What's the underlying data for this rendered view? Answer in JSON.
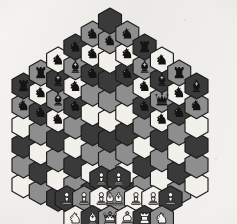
{
  "board": {
    "title": "Hexagonal Chess Board",
    "variant": "Glinski hexagonal chess",
    "orientation": "flat-top-hexagon",
    "columns": 11,
    "total_cells": 91,
    "cell_width_px": 23,
    "cell_height_px": 26,
    "column_step_x_px": 17.3,
    "origin_x_px": 12,
    "origin_y_px": 8,
    "colors": {
      "cell_light": "#f2f0ea",
      "cell_medium": "#8e8e8e",
      "cell_dark": "#3a3a3a",
      "cell_border": "#1c1c1c",
      "piece_black": "#141414",
      "piece_black_outline": "#d8d6d0",
      "piece_white": "#f4f2ec",
      "piece_white_outline": "#141414",
      "background": "#f0eeea"
    },
    "column_labels": [
      "a",
      "b",
      "c",
      "d",
      "e",
      "f",
      "g",
      "h",
      "i",
      "k",
      "l"
    ],
    "column_heights": [
      6,
      7,
      8,
      9,
      10,
      11,
      10,
      9,
      8,
      7,
      6
    ],
    "shade_cycle": [
      "light",
      "medium",
      "dark"
    ],
    "columns_data": [
      {
        "label": "a",
        "cells": [
          {
            "rank": 1,
            "shade": "light",
            "piece": null
          },
          {
            "rank": 2,
            "shade": "medium",
            "piece": null
          },
          {
            "rank": 3,
            "shade": "dark",
            "piece": null
          },
          {
            "rank": 4,
            "shade": "light",
            "piece": null
          },
          {
            "rank": 5,
            "shade": "medium",
            "piece": "black-knight"
          },
          {
            "rank": 6,
            "shade": "dark",
            "piece": "black-rook"
          }
        ]
      },
      {
        "label": "b",
        "cells": [
          {
            "rank": 1,
            "shade": "medium",
            "piece": null
          },
          {
            "rank": 2,
            "shade": "dark",
            "piece": null
          },
          {
            "rank": 3,
            "shade": "light",
            "piece": null
          },
          {
            "rank": 4,
            "shade": "medium",
            "piece": null
          },
          {
            "rank": 5,
            "shade": "dark",
            "piece": "black-knight"
          },
          {
            "rank": 6,
            "shade": "light",
            "piece": "black-knight"
          },
          {
            "rank": 7,
            "shade": "medium",
            "piece": "black-rook"
          }
        ]
      },
      {
        "label": "c",
        "cells": [
          {
            "rank": 1,
            "shade": "dark",
            "piece": null
          },
          {
            "rank": 2,
            "shade": "light",
            "piece": null
          },
          {
            "rank": 3,
            "shade": "medium",
            "piece": null
          },
          {
            "rank": 4,
            "shade": "dark",
            "piece": null
          },
          {
            "rank": 5,
            "shade": "light",
            "piece": "black-knight"
          },
          {
            "rank": 6,
            "shade": "medium",
            "piece": "black-bishop"
          },
          {
            "rank": 7,
            "shade": "dark",
            "piece": "black-bishop"
          },
          {
            "rank": 8,
            "shade": "light",
            "piece": "black-knight"
          }
        ]
      },
      {
        "label": "d",
        "cells": [
          {
            "rank": 1,
            "shade": "light",
            "piece": null
          },
          {
            "rank": 2,
            "shade": "medium",
            "piece": null
          },
          {
            "rank": 3,
            "shade": "dark",
            "piece": null
          },
          {
            "rank": 4,
            "shade": "light",
            "piece": null
          },
          {
            "rank": 5,
            "shade": "medium",
            "piece": null
          },
          {
            "rank": 6,
            "shade": "dark",
            "piece": "black-knight"
          },
          {
            "rank": 7,
            "shade": "light",
            "piece": "black-knight"
          },
          {
            "rank": 8,
            "shade": "medium",
            "piece": "black-bishop"
          },
          {
            "rank": 9,
            "shade": "dark",
            "piece": "black-knight"
          }
        ]
      },
      {
        "label": "e",
        "cells": [
          {
            "rank": 1,
            "shade": "medium",
            "piece": null
          },
          {
            "rank": 2,
            "shade": "dark",
            "piece": null
          },
          {
            "rank": 3,
            "shade": "light",
            "piece": null
          },
          {
            "rank": 4,
            "shade": "medium",
            "piece": null
          },
          {
            "rank": 5,
            "shade": "dark",
            "piece": null
          },
          {
            "rank": 6,
            "shade": "light",
            "piece": null
          },
          {
            "rank": 7,
            "shade": "medium",
            "piece": null
          },
          {
            "rank": 8,
            "shade": "dark",
            "piece": "black-knight"
          },
          {
            "rank": 9,
            "shade": "light",
            "piece": "black-knight"
          },
          {
            "rank": 10,
            "shade": "medium",
            "piece": "black-knight"
          }
        ]
      },
      {
        "label": "f",
        "cells": [
          {
            "rank": 1,
            "shade": "light",
            "piece": "white-king"
          },
          {
            "rank": 2,
            "shade": "dark",
            "piece": "white-bishop"
          },
          {
            "rank": 3,
            "shade": "light",
            "piece": null
          },
          {
            "rank": 4,
            "shade": "medium",
            "piece": null
          },
          {
            "rank": 5,
            "shade": "dark",
            "piece": null
          },
          {
            "rank": 6,
            "shade": "light",
            "piece": null
          },
          {
            "rank": 7,
            "shade": "medium",
            "piece": null
          },
          {
            "rank": 8,
            "shade": "dark",
            "piece": null
          },
          {
            "rank": 9,
            "shade": "light",
            "piece": null
          },
          {
            "rank": 10,
            "shade": "medium",
            "piece": "black-knight"
          },
          {
            "rank": 11,
            "shade": "dark",
            "piece": null
          }
        ]
      },
      {
        "label": "g",
        "cells": [
          {
            "rank": 1,
            "shade": "medium",
            "piece": null
          },
          {
            "rank": 2,
            "shade": "dark",
            "piece": null
          },
          {
            "rank": 3,
            "shade": "light",
            "piece": null
          },
          {
            "rank": 4,
            "shade": "medium",
            "piece": null
          },
          {
            "rank": 5,
            "shade": "dark",
            "piece": null
          },
          {
            "rank": 6,
            "shade": "light",
            "piece": null
          },
          {
            "rank": 7,
            "shade": "medium",
            "piece": null
          },
          {
            "rank": 8,
            "shade": "dark",
            "piece": "black-knight"
          },
          {
            "rank": 9,
            "shade": "light",
            "piece": "black-knight"
          },
          {
            "rank": 10,
            "shade": "medium",
            "piece": "black-knight"
          }
        ]
      },
      {
        "label": "h",
        "cells": [
          {
            "rank": 1,
            "shade": "light",
            "piece": null
          },
          {
            "rank": 2,
            "shade": "medium",
            "piece": null
          },
          {
            "rank": 3,
            "shade": "dark",
            "piece": null
          },
          {
            "rank": 4,
            "shade": "light",
            "piece": null
          },
          {
            "rank": 5,
            "shade": "medium",
            "piece": null
          },
          {
            "rank": 6,
            "shade": "dark",
            "piece": "black-knight"
          },
          {
            "rank": 7,
            "shade": "light",
            "piece": "black-knight"
          },
          {
            "rank": 8,
            "shade": "medium",
            "piece": "black-bishop"
          },
          {
            "rank": 9,
            "shade": "dark",
            "piece": "black-rook"
          }
        ]
      },
      {
        "label": "i",
        "cells": [
          {
            "rank": 1,
            "shade": "dark",
            "piece": null
          },
          {
            "rank": 2,
            "shade": "light",
            "piece": null
          },
          {
            "rank": 3,
            "shade": "medium",
            "piece": null
          },
          {
            "rank": 4,
            "shade": "dark",
            "piece": null
          },
          {
            "rank": 5,
            "shade": "light",
            "piece": "black-knight"
          },
          {
            "rank": 6,
            "shade": "medium",
            "piece": "black-queen"
          },
          {
            "rank": 7,
            "shade": "dark",
            "piece": "black-bishop"
          },
          {
            "rank": 8,
            "shade": "light",
            "piece": "black-knight"
          }
        ]
      },
      {
        "label": "k",
        "cells": [
          {
            "rank": 1,
            "shade": "medium",
            "piece": null
          },
          {
            "rank": 2,
            "shade": "dark",
            "piece": null
          },
          {
            "rank": 3,
            "shade": "light",
            "piece": null
          },
          {
            "rank": 4,
            "shade": "medium",
            "piece": null
          },
          {
            "rank": 5,
            "shade": "dark",
            "piece": "black-knight"
          },
          {
            "rank": 6,
            "shade": "light",
            "piece": "black-knight"
          },
          {
            "rank": 7,
            "shade": "medium",
            "piece": "black-rook"
          }
        ]
      },
      {
        "label": "l",
        "cells": [
          {
            "rank": 1,
            "shade": "light",
            "piece": null
          },
          {
            "rank": 2,
            "shade": "medium",
            "piece": null
          },
          {
            "rank": 3,
            "shade": "dark",
            "piece": null
          },
          {
            "rank": 4,
            "shade": "light",
            "piece": null
          },
          {
            "rank": 5,
            "shade": "medium",
            "piece": "black-knight"
          },
          {
            "rank": 6,
            "shade": "dark",
            "piece": "black-bishop"
          }
        ]
      }
    ],
    "white_back_rank": [
      {
        "piece": "white-knight",
        "shade": "light"
      },
      {
        "piece": "white-bishop",
        "shade": "dark"
      },
      {
        "piece": "white-queen",
        "shade": "medium"
      },
      {
        "piece": "white-king",
        "shade": "light"
      },
      {
        "piece": "white-rook",
        "shade": "dark"
      },
      {
        "piece": "white-knight",
        "shade": "medium"
      }
    ],
    "white_pawn_rank": [
      {
        "piece": "white-pawn",
        "shade": "dark"
      },
      {
        "piece": "white-pawn",
        "shade": "medium"
      },
      {
        "piece": "white-pawn",
        "shade": "light"
      },
      {
        "piece": "white-bishop",
        "shade": "medium"
      },
      {
        "piece": "white-pawn",
        "shade": "light"
      },
      {
        "piece": "white-pawn",
        "shade": "light"
      },
      {
        "piece": "white-pawn",
        "shade": "dark"
      }
    ],
    "white_advanced_pawns": [
      {
        "piece": "white-pawn",
        "shade": "dark"
      },
      {
        "piece": "white-pawn",
        "shade": "dark"
      }
    ],
    "piece_glyphs": {
      "black-king": "♚",
      "black-queen": "♛",
      "black-rook": "♜",
      "black-bishop": "♝",
      "black-knight": "♞",
      "black-pawn": "♟",
      "white-king": "♔",
      "white-queen": "♕",
      "white-rook": "♖",
      "white-bishop": "♗",
      "white-knight": "♘",
      "white-pawn": "♙"
    }
  }
}
